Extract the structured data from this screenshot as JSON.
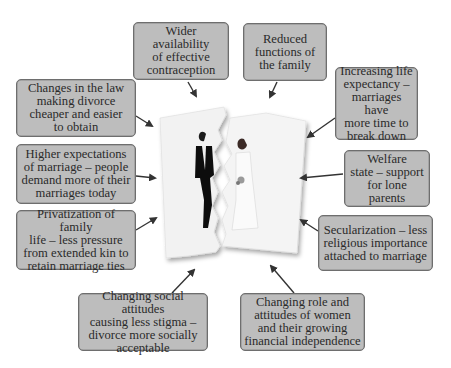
{
  "diagram": {
    "center_image": "torn-wedding-photo",
    "boxes": [
      {
        "id": "contraception",
        "text": "Wider availability\nof effective\ncontraception"
      },
      {
        "id": "reduced-functions",
        "text": "Reduced\nfunctions of\nthe family"
      },
      {
        "id": "law-changes",
        "text": "Changes in the law\nmaking divorce\ncheaper and easier\nto obtain"
      },
      {
        "id": "life-expectancy",
        "text": "Increasing life\nexpectancy –\nmarriages have\nmore time to\nbreak down"
      },
      {
        "id": "higher-expectations",
        "text": "Higher expectations\nof marriage – people\ndemand more of their\nmarriages today"
      },
      {
        "id": "welfare-state",
        "text": "Welfare\nstate – support\nfor lone parents"
      },
      {
        "id": "privatization",
        "text": "Privatization of family\nlife – less pressure\nfrom extended kin to\nretain marriage ties"
      },
      {
        "id": "secularization",
        "text": "Secularization – less\nreligious importance\nattached to marriage"
      },
      {
        "id": "social-attitudes",
        "text": "Changing social attitudes\ncausing less stigma –\ndivorce more socially\nacceptable"
      },
      {
        "id": "women-role",
        "text": "Changing role and\nattitudes of women\nand their growing\nfinancial independence"
      }
    ],
    "colors": {
      "box_fill": "#bdbdbd",
      "box_border": "#6e6e6e",
      "arrow": "#333333",
      "text": "#2a2a2a"
    }
  }
}
